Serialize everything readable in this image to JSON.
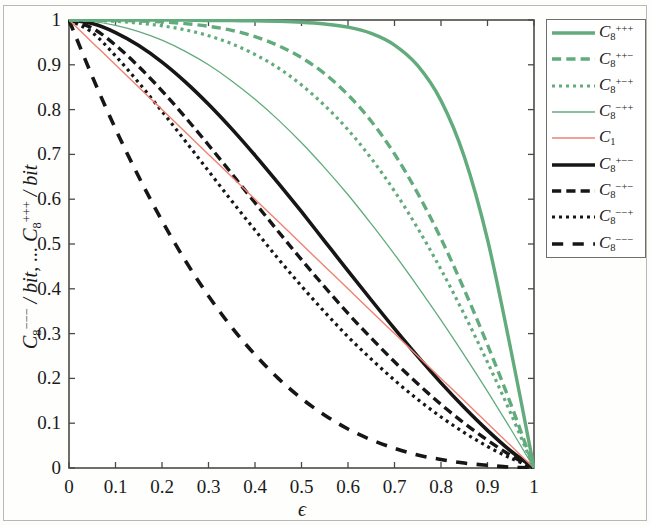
{
  "figure": {
    "background_color": "#fdfdfc",
    "frame_color": "#b9b9b4"
  },
  "axes": {
    "x_label": "ϵ",
    "y_label": "C₈⁻⁻⁻ / bit, ... C₈⁺⁺⁺ / bit",
    "y_label_parts": {
      "first_symbol": "C",
      "first_sub": "8",
      "first_sup": "−−−",
      "unit": "/ bit,",
      "ellipsis": "...",
      "second_symbol": "C",
      "second_sub": "8",
      "second_sup": "+++",
      "unit2": "/ bit"
    },
    "x_ticks": [
      "0",
      "0.1",
      "0.2",
      "0.3",
      "0.4",
      "0.5",
      "0.6",
      "0.7",
      "0.8",
      "0.9",
      "1"
    ],
    "y_ticks": [
      "0",
      "0.1",
      "0.2",
      "0.3",
      "0.4",
      "0.5",
      "0.6",
      "0.7",
      "0.8",
      "0.9",
      "1"
    ],
    "x_range": [
      0,
      1
    ],
    "y_range": [
      0,
      1
    ],
    "axis_color": "#4a4a47",
    "grid": false
  },
  "legend": {
    "position": "right-outside-top",
    "border_color": "#6e6e6b",
    "entries": [
      {
        "symbol": "C",
        "sub": "8",
        "sup": "+++",
        "color": "#62ab7c",
        "style": "solid",
        "width": 3.4,
        "name": "C8-plus-plus-plus"
      },
      {
        "symbol": "C",
        "sub": "8",
        "sup": "++−",
        "color": "#62ab7c",
        "style": "dashdot",
        "width": 3.4,
        "name": "C8-plus-plus-minus"
      },
      {
        "symbol": "C",
        "sub": "8",
        "sup": "+−+",
        "color": "#62ab7c",
        "style": "dotted",
        "width": 3.2,
        "name": "C8-plus-minus-plus"
      },
      {
        "symbol": "C",
        "sub": "8",
        "sup": "−++",
        "color": "#62ab7c",
        "style": "solid",
        "width": 1.3,
        "name": "C8-minus-plus-plus"
      },
      {
        "symbol": "C",
        "sub": "1",
        "sup": "",
        "color": "#ef8272",
        "style": "solid",
        "width": 1.4,
        "name": "C1"
      },
      {
        "symbol": "C",
        "sub": "8",
        "sup": "+−−",
        "color": "#161616",
        "style": "solid",
        "width": 3.6,
        "name": "C8-plus-minus-minus"
      },
      {
        "symbol": "C",
        "sub": "8",
        "sup": "−+−",
        "color": "#161616",
        "style": "dashdot",
        "width": 3.4,
        "name": "C8-minus-plus-minus"
      },
      {
        "symbol": "C",
        "sub": "8",
        "sup": "−−+",
        "color": "#161616",
        "style": "dotted",
        "width": 3.2,
        "name": "C8-minus-minus-plus"
      },
      {
        "symbol": "C",
        "sub": "8",
        "sup": "−−−",
        "color": "#161616",
        "style": "dashed",
        "width": 3.6,
        "name": "C8-minus-minus-minus"
      }
    ]
  },
  "chart_data": {
    "type": "line",
    "title": "",
    "xlabel": "ϵ",
    "ylabel": "C₈⁻⁻⁻ / bit, ... C₈⁺⁺⁺ / bit",
    "xlim": [
      0,
      1
    ],
    "ylim": [
      0,
      1
    ],
    "grid": false,
    "legend_position": "right-outside-top",
    "x": [
      0,
      0.05,
      0.1,
      0.15,
      0.2,
      0.25,
      0.3,
      0.35,
      0.4,
      0.45,
      0.5,
      0.55,
      0.6,
      0.65,
      0.7,
      0.75,
      0.8,
      0.85,
      0.9,
      0.95,
      1
    ],
    "series": [
      {
        "name": "C_8^{+++}",
        "color": "#62ab7c",
        "style": "solid",
        "width": 3.4,
        "values": [
          1,
          1,
          1,
          1,
          1,
          1,
          0.999,
          0.999,
          0.998,
          0.997,
          0.995,
          0.991,
          0.984,
          0.97,
          0.944,
          0.898,
          0.82,
          0.695,
          0.51,
          0.265,
          0
        ]
      },
      {
        "name": "C_8^{++-}",
        "color": "#62ab7c",
        "style": "dashdot",
        "width": 3.4,
        "values": [
          1,
          1,
          0.999,
          0.998,
          0.996,
          0.992,
          0.986,
          0.977,
          0.963,
          0.943,
          0.916,
          0.88,
          0.833,
          0.774,
          0.701,
          0.613,
          0.512,
          0.398,
          0.275,
          0.143,
          0
        ]
      },
      {
        "name": "C_8^{+-+}",
        "color": "#62ab7c",
        "style": "dotted",
        "width": 3.2,
        "values": [
          1,
          0.999,
          0.997,
          0.993,
          0.987,
          0.978,
          0.965,
          0.947,
          0.923,
          0.893,
          0.855,
          0.809,
          0.755,
          0.691,
          0.618,
          0.535,
          0.443,
          0.343,
          0.236,
          0.122,
          0
        ]
      },
      {
        "name": "C_8^{-++}",
        "color": "#62ab7c",
        "style": "solid",
        "width": 1.3,
        "values": [
          1,
          0.997,
          0.988,
          0.974,
          0.955,
          0.93,
          0.9,
          0.864,
          0.823,
          0.777,
          0.726,
          0.67,
          0.61,
          0.545,
          0.477,
          0.405,
          0.33,
          0.252,
          0.171,
          0.087,
          0
        ]
      },
      {
        "name": "C_1",
        "color": "#ef8272",
        "style": "solid",
        "width": 1.4,
        "values": [
          1,
          0.95,
          0.9,
          0.85,
          0.8,
          0.75,
          0.7,
          0.65,
          0.6,
          0.55,
          0.5,
          0.45,
          0.4,
          0.35,
          0.3,
          0.25,
          0.2,
          0.15,
          0.1,
          0.05,
          0
        ]
      },
      {
        "name": "C_8^{+--}",
        "color": "#161616",
        "style": "solid",
        "width": 3.6,
        "values": [
          1,
          0.992,
          0.972,
          0.943,
          0.906,
          0.862,
          0.812,
          0.757,
          0.698,
          0.636,
          0.572,
          0.506,
          0.44,
          0.375,
          0.311,
          0.249,
          0.19,
          0.135,
          0.084,
          0.038,
          0
        ]
      },
      {
        "name": "C_8^{-+-}",
        "color": "#161616",
        "style": "dashdot",
        "width": 3.4,
        "values": [
          1,
          0.982,
          0.944,
          0.896,
          0.842,
          0.783,
          0.721,
          0.657,
          0.592,
          0.528,
          0.465,
          0.404,
          0.345,
          0.29,
          0.237,
          0.188,
          0.142,
          0.1,
          0.062,
          0.028,
          0
        ]
      },
      {
        "name": "C_8^{--+}",
        "color": "#161616",
        "style": "dotted",
        "width": 3.2,
        "values": [
          1,
          0.972,
          0.92,
          0.86,
          0.796,
          0.73,
          0.663,
          0.596,
          0.531,
          0.467,
          0.406,
          0.348,
          0.293,
          0.243,
          0.196,
          0.153,
          0.114,
          0.079,
          0.048,
          0.022,
          0
        ]
      },
      {
        "name": "C_8^{---}",
        "color": "#161616",
        "style": "dashed",
        "width": 3.6,
        "values": [
          1,
          0.874,
          0.757,
          0.65,
          0.552,
          0.463,
          0.384,
          0.314,
          0.253,
          0.2,
          0.155,
          0.118,
          0.087,
          0.063,
          0.044,
          0.029,
          0.019,
          0.011,
          0.006,
          0.002,
          0
        ]
      }
    ]
  }
}
